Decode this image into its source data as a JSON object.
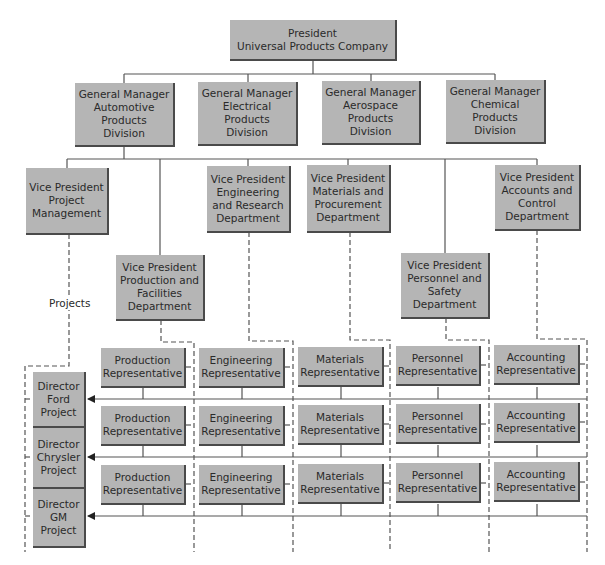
{
  "diagram": {
    "type": "organizational-chart (matrix structure)",
    "president": {
      "label": "President\nUniversal Products Company"
    },
    "general_managers": [
      {
        "label": "General Manager\nAutomotive\nProducts\nDivision"
      },
      {
        "label": "General Manager\nElectrical\nProducts\nDivision"
      },
      {
        "label": "General Manager\nAerospace\nProducts\nDivision"
      },
      {
        "label": "General Manager\nChemical\nProducts\nDivision"
      }
    ],
    "vice_presidents": [
      {
        "label": "Vice President\nProject\nManagement"
      },
      {
        "label": "Vice President\nProduction and\nFacilities\nDepartment"
      },
      {
        "label": "Vice President\nEngineering\nand Research\nDepartment"
      },
      {
        "label": "Vice President\nMaterials and\nProcurement\nDepartment"
      },
      {
        "label": "Vice President\nPersonnel and\nSafety\nDepartment"
      },
      {
        "label": "Vice President\nAccounts and\nControl\nDepartment"
      }
    ],
    "projects_label": "Projects",
    "directors": [
      {
        "label": "Director\nFord\nProject"
      },
      {
        "label": "Director\nChrysler\nProject"
      },
      {
        "label": "Director\nGM\nProject"
      }
    ],
    "representatives": {
      "columns": [
        "Production\nRepresentative",
        "Engineering\nRepresentative",
        "Materials\nRepresentative",
        "Personnel\nRepresentative",
        "Accounting\nRepresentative"
      ],
      "rows": 3
    },
    "colors": {
      "box_fill": "#b5b5b5",
      "box_shadow": "#4a4a4a",
      "line": "#555555"
    }
  }
}
